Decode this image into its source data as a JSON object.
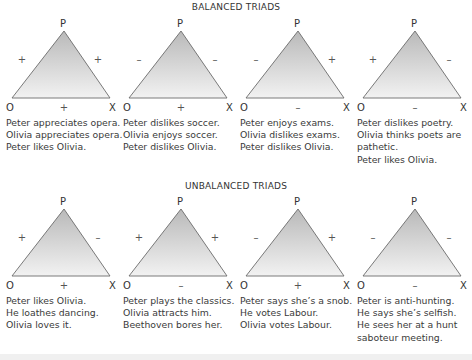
{
  "sections": [
    {
      "title": "BALANCED TRIADS",
      "triads": [
        {
          "vertices": {
            "top": "P",
            "left": "O",
            "right": "X"
          },
          "signs": {
            "po": "+",
            "px": "+",
            "ox": "+"
          },
          "lines": [
            "Peter appreciates opera.",
            "Olivia appreciates opera.",
            "Peter likes Olivia."
          ]
        },
        {
          "vertices": {
            "top": "P",
            "left": "O",
            "right": "X"
          },
          "signs": {
            "po": "–",
            "px": "–",
            "ox": "+"
          },
          "lines": [
            "Peter dislikes soccer.",
            "Olivia enjoys soccer.",
            "Peter dislikes Olivia."
          ]
        },
        {
          "vertices": {
            "top": "P",
            "left": "O",
            "right": "X"
          },
          "signs": {
            "po": "–",
            "px": "+",
            "ox": "–"
          },
          "lines": [
            "Peter enjoys exams.",
            "Olivia dislikes exams.",
            "Peter dislikes Olivia."
          ]
        },
        {
          "vertices": {
            "top": "P",
            "left": "O",
            "right": "X"
          },
          "signs": {
            "po": "+",
            "px": "–",
            "ox": "–"
          },
          "lines": [
            "Peter dislikes poetry.",
            "Olivia thinks poets are",
            "pathetic.",
            "Peter likes Olivia."
          ]
        }
      ]
    },
    {
      "title": "UNBALANCED TRIADS",
      "triads": [
        {
          "vertices": {
            "top": "P",
            "left": "O",
            "right": "X"
          },
          "signs": {
            "po": "+",
            "px": "–",
            "ox": "+"
          },
          "lines": [
            "Peter likes Olivia.",
            "He loathes dancing.",
            "Olivia loves it."
          ]
        },
        {
          "vertices": {
            "top": "P",
            "left": "O",
            "right": "X"
          },
          "signs": {
            "po": "+",
            "px": "+",
            "ox": "–"
          },
          "lines": [
            "Peter plays the classics.",
            "Olivia attracts him.",
            "Beethoven bores her."
          ]
        },
        {
          "vertices": {
            "top": "P",
            "left": "O",
            "right": "X"
          },
          "signs": {
            "po": "–",
            "px": "+",
            "ox": "+"
          },
          "lines": [
            "Peter says she’s a snob.",
            "He votes Labour.",
            "Olivia votes Labour."
          ]
        },
        {
          "vertices": {
            "top": "P",
            "left": "O",
            "right": "X"
          },
          "signs": {
            "po": "–",
            "px": "–",
            "ox": "–"
          },
          "lines": [
            "Peter is anti-hunting.",
            "He says she’s selfish.",
            "He sees her at a hunt",
            "saboteur meeting."
          ]
        }
      ]
    }
  ],
  "colors": {
    "triangle_top": "#b9b9b9",
    "triangle_bottom": "#f2f2f2",
    "edge": "#6b6b6b"
  }
}
